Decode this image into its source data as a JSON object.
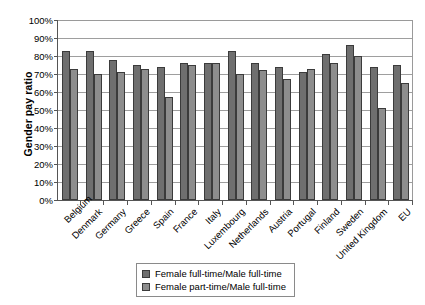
{
  "chart_data": {
    "type": "bar",
    "title": "",
    "xlabel": "",
    "ylabel": "Gender pay ratio",
    "ylim": [
      0,
      100
    ],
    "y_tick_labels": [
      "100%",
      "90%",
      "80%",
      "70%",
      "60%",
      "50%",
      "40%",
      "30%",
      "20%",
      "10%",
      "0%"
    ],
    "y_tick_values": [
      100,
      90,
      80,
      70,
      60,
      50,
      40,
      30,
      20,
      10,
      0
    ],
    "grid": "horizontal",
    "legend_position": "bottom",
    "categories": [
      "Belgium",
      "Denmark",
      "Germany",
      "Greece",
      "Spain",
      "France",
      "Italy",
      "Luxembourg",
      "Netherlands",
      "Austria",
      "Portugal",
      "Finland",
      "Sweden",
      "United Kingdom",
      "EU"
    ],
    "series": [
      {
        "name": "Female full-time/Male full-time",
        "color": "#6f6f6f",
        "values": [
          83,
          83,
          78,
          75,
          74,
          76,
          76,
          83,
          76,
          74,
          71,
          81,
          86,
          74,
          75
        ]
      },
      {
        "name": "Female part-time/Male full-time",
        "color": "#8d8d8d",
        "values": [
          73,
          70,
          71,
          73,
          57,
          75,
          76,
          70,
          72,
          67,
          73,
          76,
          80,
          51,
          65
        ]
      }
    ]
  }
}
